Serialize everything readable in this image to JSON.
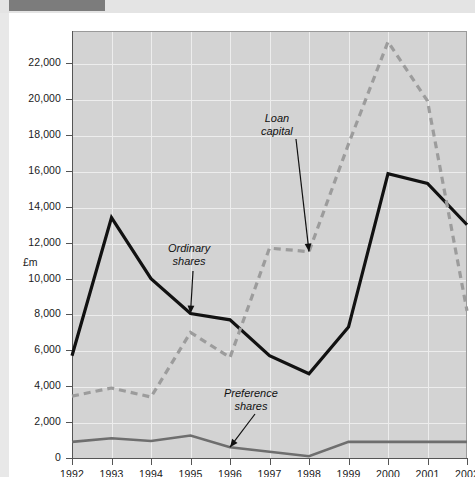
{
  "page": {
    "background_color": "#ffffff",
    "top_band_color": "#e4e4e4",
    "top_band_marker_color": "#7c7c7c"
  },
  "chart_data": {
    "type": "line",
    "title": "",
    "subtitle": "",
    "xlabel": "",
    "ylabel": "£m",
    "x": [
      1992,
      1993,
      1994,
      1995,
      1996,
      1997,
      1998,
      1999,
      2000,
      2001,
      2002
    ],
    "categories": [
      "1992",
      "1993",
      "1994",
      "1995",
      "1996",
      "1997",
      "1998",
      "1999",
      "2000",
      "2001",
      "2002"
    ],
    "xlim": [
      1992,
      2002
    ],
    "ylim": [
      0,
      23800
    ],
    "yticks": [
      0,
      2000,
      4000,
      6000,
      8000,
      10000,
      12000,
      14000,
      16000,
      18000,
      20000,
      22000
    ],
    "ytick_labels": [
      "0",
      "2,000",
      "4,000",
      "6,000",
      "8,000",
      "10,000",
      "12,000",
      "14,000",
      "16,000",
      "18,000",
      "20,000",
      "22,000"
    ],
    "grid": true,
    "grid_color": "#ededed",
    "plot_background": "#d3d3d3",
    "legend": "none",
    "series": [
      {
        "name": "Ordinary shares",
        "color": "#111111",
        "style": "solid",
        "width": 3.2,
        "values": [
          5700,
          13400,
          10000,
          8050,
          7700,
          5700,
          4700,
          7300,
          15850,
          15300,
          13000
        ]
      },
      {
        "name": "Loan capital",
        "color": "#9c9c9c",
        "style": "dashed",
        "width": 3.2,
        "values": [
          3450,
          3900,
          3400,
          7000,
          5600,
          11700,
          11500,
          17500,
          23200,
          19900,
          8200
        ]
      },
      {
        "name": "Preference shares",
        "color": "#6e6e6e",
        "style": "solid",
        "width": 2.6,
        "values": [
          900,
          1100,
          950,
          1250,
          600,
          350,
          100,
          900,
          900,
          900,
          900
        ]
      }
    ],
    "annotations": [
      {
        "id": "loan-capital",
        "text_line1": "Loan",
        "text_line2": "capital",
        "points_to_series": "Loan capital",
        "points_to_x": 1998
      },
      {
        "id": "ordinary-shares",
        "text_line1": "Ordinary",
        "text_line2": "shares",
        "points_to_series": "Ordinary shares",
        "points_to_x": 1995
      },
      {
        "id": "preference-shares",
        "text_line1": "Preference",
        "text_line2": "shares",
        "points_to_series": "Preference shares",
        "points_to_x": 1996
      }
    ]
  }
}
